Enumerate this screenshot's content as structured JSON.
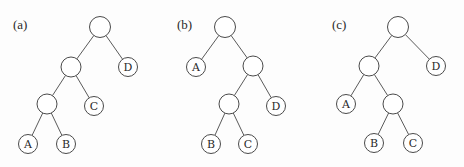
{
  "diagram": {
    "style": {
      "edge_color": "#5a5a5a",
      "node_stroke": "#4a4a4a",
      "node_fill": "#ffffff",
      "text_color": "#2a2a2a"
    },
    "panels": [
      {
        "id": "a",
        "label": "(a)",
        "label_pos": [
          13,
          29
        ],
        "nodes": [
          {
            "id": "a-root",
            "x": 100,
            "y": 27,
            "r": 10.5,
            "label": ""
          },
          {
            "id": "a-n1",
            "x": 71,
            "y": 67,
            "r": 10,
            "label": ""
          },
          {
            "id": "a-D",
            "x": 128,
            "y": 67,
            "r": 9.5,
            "label": "D"
          },
          {
            "id": "a-n2",
            "x": 47,
            "y": 104,
            "r": 10,
            "label": ""
          },
          {
            "id": "a-C",
            "x": 94,
            "y": 106,
            "r": 9.5,
            "label": "C"
          },
          {
            "id": "a-A",
            "x": 28,
            "y": 144,
            "r": 9.5,
            "label": "A"
          },
          {
            "id": "a-B",
            "x": 66,
            "y": 144,
            "r": 9.5,
            "label": "B"
          }
        ],
        "edges": [
          [
            "a-root",
            "a-n1"
          ],
          [
            "a-root",
            "a-D"
          ],
          [
            "a-n1",
            "a-n2"
          ],
          [
            "a-n1",
            "a-C"
          ],
          [
            "a-n2",
            "a-A"
          ],
          [
            "a-n2",
            "a-B"
          ]
        ]
      },
      {
        "id": "b",
        "label": "(b)",
        "label_pos": [
          177,
          29
        ],
        "nodes": [
          {
            "id": "b-root",
            "x": 225,
            "y": 27,
            "r": 10.5,
            "label": ""
          },
          {
            "id": "b-A",
            "x": 196,
            "y": 67,
            "r": 9.5,
            "label": "A"
          },
          {
            "id": "b-n1",
            "x": 253,
            "y": 66,
            "r": 10,
            "label": ""
          },
          {
            "id": "b-n2",
            "x": 229,
            "y": 104,
            "r": 10,
            "label": ""
          },
          {
            "id": "b-D",
            "x": 276,
            "y": 106,
            "r": 9.5,
            "label": "D"
          },
          {
            "id": "b-B",
            "x": 211,
            "y": 144,
            "r": 9.5,
            "label": "B"
          },
          {
            "id": "b-C",
            "x": 248,
            "y": 144,
            "r": 9.5,
            "label": "C"
          }
        ],
        "edges": [
          [
            "b-root",
            "b-A"
          ],
          [
            "b-root",
            "b-n1"
          ],
          [
            "b-n1",
            "b-n2"
          ],
          [
            "b-n1",
            "b-D"
          ],
          [
            "b-n2",
            "b-B"
          ],
          [
            "b-n2",
            "b-C"
          ]
        ]
      },
      {
        "id": "c",
        "label": "(c)",
        "label_pos": [
          332,
          29
        ],
        "nodes": [
          {
            "id": "c-root",
            "x": 398,
            "y": 27,
            "r": 10.5,
            "label": ""
          },
          {
            "id": "c-n1",
            "x": 369,
            "y": 66,
            "r": 10,
            "label": ""
          },
          {
            "id": "c-D",
            "x": 436,
            "y": 66,
            "r": 9.5,
            "label": "D"
          },
          {
            "id": "c-A",
            "x": 346,
            "y": 104,
            "r": 9.5,
            "label": "A"
          },
          {
            "id": "c-n2",
            "x": 393,
            "y": 104,
            "r": 10,
            "label": ""
          },
          {
            "id": "c-B",
            "x": 374,
            "y": 143,
            "r": 9.5,
            "label": "B"
          },
          {
            "id": "c-C",
            "x": 413,
            "y": 143,
            "r": 9.5,
            "label": "C"
          }
        ],
        "edges": [
          [
            "c-root",
            "c-n1"
          ],
          [
            "c-root",
            "c-D"
          ],
          [
            "c-n1",
            "c-A"
          ],
          [
            "c-n1",
            "c-n2"
          ],
          [
            "c-n2",
            "c-B"
          ],
          [
            "c-n2",
            "c-C"
          ]
        ]
      }
    ]
  }
}
